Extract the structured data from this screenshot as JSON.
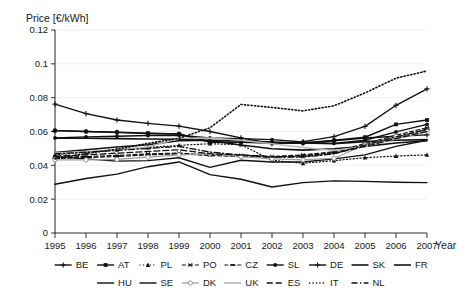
{
  "chart_data": {
    "type": "line",
    "title": "",
    "ylabel": "Price [€/kWh]",
    "xlabel": "Year",
    "grid": true,
    "legend_position": "bottom",
    "x": [
      1995,
      1996,
      1997,
      1998,
      1999,
      2000,
      2001,
      2002,
      2003,
      2004,
      2005,
      2006,
      2007
    ],
    "xticklabels": [
      "1995",
      "1996",
      "1997",
      "1998",
      "1999",
      "2000",
      "2001",
      "2002",
      "2003",
      "2004",
      "2005",
      "2006",
      "2007"
    ],
    "ylim": [
      0,
      0.12
    ],
    "yticks": [
      0,
      0.02,
      0.04,
      0.06,
      0.08,
      0.1,
      0.12
    ],
    "yticklabels": [
      "0",
      "0.02",
      "0.04",
      "0.06",
      "0.08",
      "0.1",
      "0.12"
    ],
    "series": [
      {
        "name": "BE",
        "marker": "plus",
        "dash": "none",
        "color": "#111111",
        "width": 1.4,
        "values": [
          0.0605,
          0.06,
          0.0595,
          0.0588,
          0.0585,
          0.0538,
          0.0536,
          0.0532,
          0.053,
          0.0545,
          0.0562,
          0.0572,
          0.058
        ]
      },
      {
        "name": "AT",
        "marker": "square",
        "dash": "none",
        "color": "#111111",
        "width": 1.4,
        "values": [
          0.0605,
          0.06,
          0.0596,
          0.059,
          0.0586,
          0.0538,
          0.0537,
          0.0533,
          0.0532,
          0.0548,
          0.0566,
          0.0642,
          0.0668
        ]
      },
      {
        "name": "PL",
        "marker": "triangle",
        "dash": "dot",
        "color": "#111111",
        "width": 1.2,
        "values": [
          0.0462,
          0.0478,
          0.0492,
          0.0505,
          0.0518,
          0.0528,
          0.0522,
          0.043,
          0.0412,
          0.0428,
          0.0445,
          0.0455,
          0.0462
        ]
      },
      {
        "name": "PO",
        "marker": "star",
        "dash": "dash",
        "color": "#111111",
        "width": 1.2,
        "values": [
          0.0448,
          0.0452,
          0.0458,
          0.0468,
          0.0472,
          0.0462,
          0.0458,
          0.0452,
          0.0462,
          0.048,
          0.0528,
          0.0578,
          0.0622
        ]
      },
      {
        "name": "CZ",
        "marker": "dash",
        "dash": "dash",
        "color": "#111111",
        "width": 1.2,
        "values": [
          0.044,
          0.0446,
          0.0452,
          0.0462,
          0.0468,
          0.0458,
          0.0452,
          0.0448,
          0.0458,
          0.0474,
          0.052,
          0.0568,
          0.0612
        ]
      },
      {
        "name": "SL",
        "marker": "dot",
        "dash": "none",
        "color": "#111111",
        "width": 1.4,
        "values": [
          0.0562,
          0.0568,
          0.0572,
          0.0576,
          0.0578,
          0.0562,
          0.0558,
          0.0552,
          0.0538,
          0.053,
          0.0548,
          0.0598,
          0.0642
        ]
      },
      {
        "name": "DE",
        "marker": "plus",
        "dash": "none",
        "color": "#111111",
        "width": 1.4,
        "values": [
          0.0762,
          0.0706,
          0.0668,
          0.0648,
          0.0632,
          0.06,
          0.0562,
          0.0528,
          0.054,
          0.057,
          0.063,
          0.0755,
          0.0852
        ]
      },
      {
        "name": "SK",
        "marker": "none",
        "dash": "none",
        "color": "#111111",
        "width": 1.6,
        "values": [
          0.056,
          0.056,
          0.0558,
          0.0556,
          0.0554,
          0.0546,
          0.052,
          0.0498,
          0.049,
          0.0498,
          0.0512,
          0.0532,
          0.0545
        ]
      },
      {
        "name": "FR",
        "marker": "none",
        "dash": "none",
        "color": "#111111",
        "width": 1.6,
        "values": [
          0.0476,
          0.0492,
          0.0508,
          0.0522,
          0.0545,
          0.0548,
          0.0545,
          0.0538,
          0.0532,
          0.0528,
          0.054,
          0.0548,
          0.0552
        ]
      },
      {
        "name": "HU",
        "marker": "none",
        "dash": "none",
        "color": "#111111",
        "width": 1.4,
        "values": [
          0.0288,
          0.0322,
          0.0348,
          0.0392,
          0.042,
          0.0345,
          0.0318,
          0.0272,
          0.0298,
          0.0308,
          0.0305,
          0.03,
          0.0298
        ]
      },
      {
        "name": "SE",
        "marker": "none",
        "dash": "none",
        "color": "#111111",
        "width": 1.4,
        "values": [
          0.0452,
          0.0438,
          0.0425,
          0.0428,
          0.0445,
          0.0388,
          0.043,
          0.042,
          0.042,
          0.0438,
          0.0462,
          0.0512,
          0.0548
        ]
      },
      {
        "name": "DK",
        "marker": "circle",
        "dash": "none",
        "color": "#9a9a9a",
        "width": 1.2,
        "values": [
          0.0432,
          0.0432,
          0.0435,
          0.0448,
          0.0462,
          0.0468,
          0.0452,
          0.0438,
          0.0432,
          0.0442,
          0.052,
          0.0572,
          0.06
        ]
      },
      {
        "name": "UK",
        "marker": "none",
        "dash": "none",
        "color": "#b8b8b8",
        "width": 1.6,
        "values": [
          0.0472,
          0.048,
          0.0492,
          0.0508,
          0.056,
          0.0562,
          0.0548,
          0.0528,
          0.0505,
          0.0488,
          0.0512,
          0.0558,
          0.0598
        ]
      },
      {
        "name": "ES",
        "marker": "none",
        "dash": "longdash",
        "color": "#111111",
        "width": 1.3,
        "values": [
          0.0455,
          0.0462,
          0.0472,
          0.0482,
          0.0492,
          0.0468,
          0.0462,
          0.0452,
          0.0452,
          0.047,
          0.0512,
          0.0558,
          0.06
        ]
      },
      {
        "name": "IT",
        "marker": "none",
        "dash": "dot",
        "color": "#111111",
        "width": 1.6,
        "values": [
          0.0438,
          0.047,
          0.0495,
          0.053,
          0.056,
          0.0622,
          0.076,
          0.0742,
          0.0722,
          0.0752,
          0.0828,
          0.0915,
          0.0958
        ]
      },
      {
        "name": "NL",
        "marker": "none",
        "dash": "dashdot",
        "color": "#111111",
        "width": 1.3,
        "values": [
          0.0468,
          0.0478,
          0.0488,
          0.05,
          0.0512,
          0.0478,
          0.0462,
          0.0448,
          0.0448,
          0.0468,
          0.052,
          0.0568,
          0.0612
        ]
      }
    ]
  },
  "legend": {
    "rows": [
      [
        "BE",
        "AT",
        "PL",
        "PO",
        "CZ",
        "SL",
        "DE",
        "SK",
        "FR"
      ],
      [
        "HU",
        "SE",
        "DK",
        "UK",
        "ES",
        "IT",
        "NL"
      ]
    ]
  }
}
